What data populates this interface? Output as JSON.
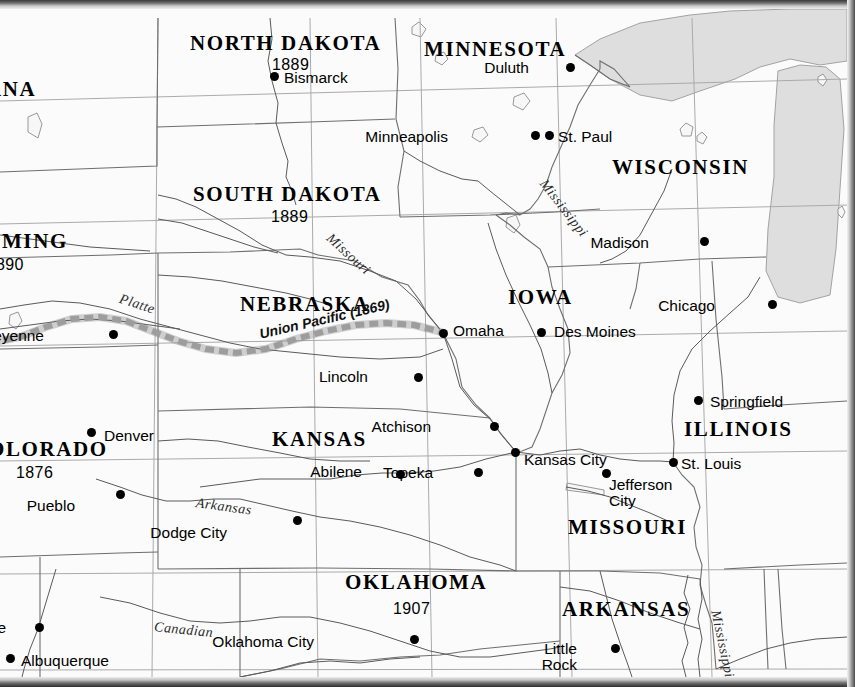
{
  "map": {
    "title": "Central United States — Statehood Dates, Capitals and the Union Pacific Railroad",
    "projection_note": "",
    "colors": {
      "land": "#fbfbfb",
      "water": "#dedede",
      "state_border": "#6e6e6e",
      "graticule": "#a8a8a8",
      "river": "#555555",
      "railroad": "#9a9a9a",
      "text": "#000000",
      "frame": "#3a3a3a"
    },
    "states": [
      {
        "id": "montana",
        "name": "ANA",
        "full": "MONTANA",
        "year": "",
        "x": -14,
        "y": 70,
        "clipped": true
      },
      {
        "id": "north-dakota",
        "name": "NORTH DAKOTA",
        "full": "NORTH DAKOTA",
        "year": "1889",
        "x": 190,
        "y": 24,
        "clipped": false
      },
      {
        "id": "minnesota",
        "name": "MINNESOTA",
        "full": "MINNESOTA",
        "year": "",
        "x": 424,
        "y": 30,
        "clipped": false
      },
      {
        "id": "south-dakota",
        "name": "SOUTH DAKOTA",
        "full": "SOUTH DAKOTA",
        "year": "1889",
        "x": 193,
        "y": 175,
        "clipped": false
      },
      {
        "id": "wisconsin",
        "name": "WISCONSIN",
        "full": "WISCONSIN",
        "year": "",
        "x": 612,
        "y": 148,
        "clipped": false
      },
      {
        "id": "wyoming",
        "name": "OMING",
        "full": "WYOMING",
        "year": "890",
        "x": -16,
        "y": 222,
        "clipped": true
      },
      {
        "id": "nebraska",
        "name": "NEBRASKA",
        "full": "NEBRASKA",
        "year": "",
        "x": 240,
        "y": 285,
        "clipped": false
      },
      {
        "id": "iowa",
        "name": "IOWA",
        "full": "IOWA",
        "year": "",
        "x": 508,
        "y": 278,
        "clipped": false
      },
      {
        "id": "illinois",
        "name": "ILLINOIS",
        "full": "ILLINOIS",
        "year": "",
        "x": 684,
        "y": 410,
        "clipped": false
      },
      {
        "id": "colorado",
        "name": "OLORADO",
        "full": "COLORADO",
        "year": "1876",
        "x": -12,
        "y": 430,
        "clipped": true
      },
      {
        "id": "kansas",
        "name": "KANSAS",
        "full": "KANSAS",
        "year": "",
        "x": 272,
        "y": 420,
        "clipped": false
      },
      {
        "id": "missouri",
        "name": "MISSOURI",
        "full": "MISSOURI",
        "year": "",
        "x": 568,
        "y": 508,
        "clipped": false
      },
      {
        "id": "oklahoma",
        "name": "OKLAHOMA",
        "full": "OKLAHOMA",
        "year": "1907",
        "x": 345,
        "y": 563,
        "clipped": false
      },
      {
        "id": "arkansas",
        "name": "ARKANSAS",
        "full": "ARKANSAS",
        "year": "",
        "x": 562,
        "y": 590,
        "clipped": false
      }
    ],
    "state_years": [
      {
        "id": "year-north-dakota",
        "value": "1889",
        "x": 272,
        "y": 48
      },
      {
        "id": "year-south-dakota",
        "value": "1889",
        "x": 271,
        "y": 200
      },
      {
        "id": "year-wyoming",
        "value": "890",
        "x": -4,
        "y": 248
      },
      {
        "id": "year-colorado",
        "value": "1876",
        "x": 16,
        "y": 456
      },
      {
        "id": "year-oklahoma",
        "value": "1907",
        "x": 393,
        "y": 592
      }
    ],
    "cities": [
      {
        "id": "bismarck",
        "label": "Bismarck",
        "dot_x": 274,
        "dot_y": 67,
        "lx": 284,
        "ly": 61,
        "anchor": "left",
        "lines": 1
      },
      {
        "id": "duluth",
        "label": "Duluth",
        "dot_x": 570,
        "dot_y": 58,
        "lx": 521,
        "ly": 51,
        "anchor": "right",
        "lines": 1
      },
      {
        "id": "minneapolis",
        "label": "Minneapolis",
        "dot_x": 535,
        "dot_y": 126,
        "lx": 440,
        "ly": 120,
        "anchor": "right",
        "lines": 1
      },
      {
        "id": "st-paul",
        "label": "St. Paul",
        "dot_x": 549,
        "dot_y": 126,
        "lx": 558,
        "ly": 120,
        "anchor": "left",
        "lines": 1
      },
      {
        "id": "madison",
        "label": "Madison",
        "dot_x": 704,
        "dot_y": 232,
        "lx": 641,
        "ly": 226,
        "anchor": "right",
        "lines": 1
      },
      {
        "id": "chicago",
        "label": "Chicago",
        "dot_x": 772,
        "dot_y": 295,
        "lx": 707,
        "ly": 289,
        "anchor": "right",
        "lines": 1
      },
      {
        "id": "cheyenne",
        "label": "Cheyenne",
        "dot_x": 113,
        "dot_y": 325,
        "lx": 36,
        "ly": 319,
        "anchor": "right",
        "lines": 1
      },
      {
        "id": "omaha",
        "label": "Omaha",
        "dot_x": 443,
        "dot_y": 324,
        "lx": 453,
        "ly": 314,
        "anchor": "left",
        "lines": 1
      },
      {
        "id": "des-moines",
        "label": "Des Moines",
        "dot_x": 541,
        "dot_y": 323,
        "lx": 554,
        "ly": 315,
        "anchor": "left",
        "lines": 1
      },
      {
        "id": "lincoln",
        "label": "Lincoln",
        "dot_x": 418,
        "dot_y": 368,
        "lx": 360,
        "ly": 360,
        "anchor": "right",
        "lines": 1
      },
      {
        "id": "springfield",
        "label": "Springfield",
        "dot_x": 698,
        "dot_y": 391,
        "lx": 710,
        "ly": 385,
        "anchor": "left",
        "lines": 1
      },
      {
        "id": "denver",
        "label": "Denver",
        "dot_x": 91,
        "dot_y": 423,
        "lx": 104,
        "ly": 419,
        "anchor": "left",
        "lines": 1
      },
      {
        "id": "atchison",
        "label": "Atchison",
        "dot_x": 494,
        "dot_y": 417,
        "lx": 423,
        "ly": 410,
        "anchor": "right",
        "lines": 1
      },
      {
        "id": "kansas-city",
        "label": "Kansas City",
        "dot_x": 515,
        "dot_y": 443,
        "lx": 524,
        "ly": 443,
        "anchor": "left",
        "lines": 1
      },
      {
        "id": "st-louis",
        "label": "St. Louis",
        "dot_x": 673,
        "dot_y": 453,
        "lx": 681,
        "ly": 447,
        "anchor": "left",
        "lines": 1
      },
      {
        "id": "abilene",
        "label": "Abilene",
        "dot_x": 400,
        "dot_y": 465,
        "lx": 354,
        "ly": 455,
        "anchor": "right",
        "lines": 1
      },
      {
        "id": "topeka",
        "label": "Topeka",
        "dot_x": 478,
        "dot_y": 463,
        "lx": 425,
        "ly": 456,
        "anchor": "right",
        "lines": 1
      },
      {
        "id": "jefferson-city",
        "label": "Jefferson\nCity",
        "dot_x": 606,
        "dot_y": 464,
        "lx": 609,
        "ly": 468,
        "anchor": "left",
        "lines": 2
      },
      {
        "id": "pueblo",
        "label": "Pueblo",
        "dot_x": 120,
        "dot_y": 485,
        "lx": 67,
        "ly": 489,
        "anchor": "right",
        "lines": 1
      },
      {
        "id": "dodge-city",
        "label": "Dodge City",
        "dot_x": 297,
        "dot_y": 511,
        "lx": 219,
        "ly": 516,
        "anchor": "right",
        "lines": 1
      },
      {
        "id": "santa-fe",
        "label": "a Fe",
        "dot_x": 39,
        "dot_y": 618,
        "lx": -2,
        "ly": 611,
        "anchor": "right",
        "lines": 1
      },
      {
        "id": "albuquerque",
        "label": "Albuquerque",
        "dot_x": 10,
        "dot_y": 649,
        "lx": 21,
        "ly": 644,
        "anchor": "left",
        "lines": 1
      },
      {
        "id": "oklahoma-city",
        "label": "Oklahoma City",
        "dot_x": 414,
        "dot_y": 630,
        "lx": 306,
        "ly": 625,
        "anchor": "right",
        "lines": 1
      },
      {
        "id": "little-rock",
        "label": "Little\nRock",
        "dot_x": 615,
        "dot_y": 639,
        "lx": 569,
        "ly": 632,
        "anchor": "right",
        "lines": 2
      }
    ],
    "rivers": [
      {
        "id": "missouri",
        "label": "Missouri",
        "x": 333,
        "y": 222,
        "rotate": 42
      },
      {
        "id": "mississippi-n",
        "label": "Mississippi",
        "x": 548,
        "y": 168,
        "rotate": 52
      },
      {
        "id": "mississippi-s",
        "label": "Mississippi",
        "x": 722,
        "y": 600,
        "rotate": 78
      },
      {
        "id": "platte",
        "label": "Platte",
        "x": 122,
        "y": 283,
        "rotate": 18
      },
      {
        "id": "arkansas",
        "label": "Arkansas",
        "x": 197,
        "y": 487,
        "rotate": 8
      },
      {
        "id": "canadian",
        "label": "Canadian",
        "x": 155,
        "y": 611,
        "rotate": 6
      }
    ],
    "railroads": [
      {
        "id": "union-pacific",
        "label": "Union Pacific (1869)",
        "x": 258,
        "y": 318,
        "rotate": -13,
        "year": "1869",
        "style": "dashed-gray-band"
      }
    ],
    "water_bodies": [
      {
        "id": "lake-superior",
        "label": ""
      },
      {
        "id": "lake-michigan",
        "label": ""
      },
      {
        "id": "lake-of-the-ozarks",
        "label": ""
      }
    ]
  }
}
